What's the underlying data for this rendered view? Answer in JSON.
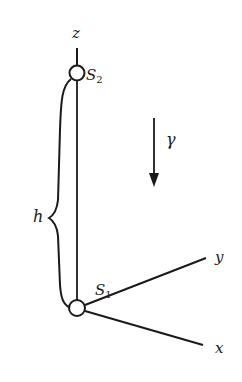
{
  "diagram": {
    "labels": {
      "z_axis": "z",
      "y_axis": "y",
      "x_axis": "x",
      "top_point": "S",
      "top_point_sub": "2",
      "bottom_point": "S",
      "bottom_point_sub": "1",
      "height": "h",
      "gravity": "γ"
    },
    "colors": {
      "stroke": "#1a1a1a",
      "background": "#ffffff"
    }
  }
}
